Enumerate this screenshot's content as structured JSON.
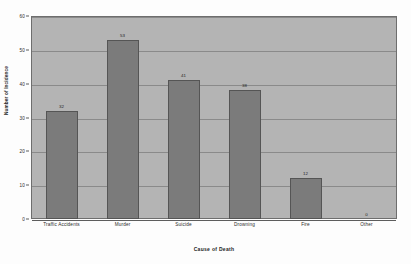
{
  "chart_data": {
    "type": "bar",
    "title": "",
    "categories": [
      "Traffic Accidents",
      "Murder",
      "Suicide",
      "Drowning",
      "Fire",
      "Other"
    ],
    "values": [
      32,
      53,
      41,
      38,
      12,
      0
    ],
    "data_labels": [
      "32",
      "53",
      "41",
      "38",
      "12",
      "0"
    ],
    "xlabel": "Cause of Death",
    "ylabel": "Number of Incidence",
    "ylim": [
      0,
      60
    ],
    "ytick_labels": [
      "60",
      "50",
      "40",
      "30",
      "20",
      "10",
      "0"
    ],
    "ytick_values": [
      60,
      50,
      40,
      30,
      20,
      10,
      0
    ],
    "grid": true,
    "legend": "none",
    "colors": {
      "bar_fill": "#7b7b7b",
      "bar_border": "#555555",
      "plot_background": "#b4b4b4",
      "gridline": "#8a8a8a",
      "axis": "#5d5d5d",
      "page_background": "#fdfdfd",
      "text": "#1f1f1f"
    }
  }
}
